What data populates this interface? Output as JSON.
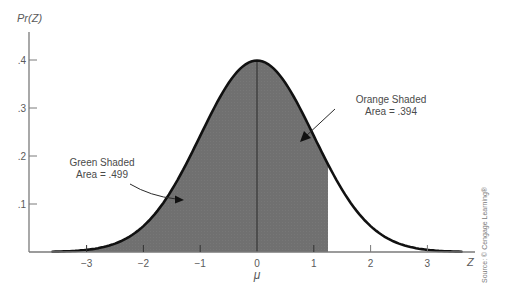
{
  "chart_data": {
    "type": "area",
    "title": "",
    "xlabel": "Z",
    "ylabel": "Pr(Z)",
    "x_center_label": "μ",
    "distribution": "standard normal",
    "xlim": [
      -3.7,
      3.7
    ],
    "ylim": [
      0,
      0.45
    ],
    "x_ticks": [
      -3,
      -2,
      -1,
      0,
      1,
      2,
      3
    ],
    "x_tick_labels": [
      "−3",
      "−2",
      "−1",
      "0",
      "1",
      "2",
      "3"
    ],
    "y_ticks": [
      0.1,
      0.2,
      0.3,
      0.4
    ],
    "y_tick_labels": [
      ".1",
      ".2",
      ".3",
      ".4"
    ],
    "grid": false,
    "curve_peak": 0.399,
    "shaded_regions": [
      {
        "name": "Green Shaded",
        "from": -3.0,
        "to": 0.0,
        "area": 0.499,
        "color": "#6e6e6e"
      },
      {
        "name": "Orange Shaded",
        "from": 0.0,
        "to": 1.25,
        "area": 0.394,
        "color": "#6e6e6e"
      }
    ],
    "annotations": [
      {
        "line1": "Green Shaded",
        "line2": "Area = .499",
        "arrow_target_z": -1.3
      },
      {
        "line1": "Orange Shaded",
        "line2": "Area = .394",
        "arrow_target_z": 0.7
      }
    ],
    "source": "Source: © Cengage Learning®"
  },
  "labels": {
    "y_axis": "Pr(Z)",
    "x_axis": "Z",
    "mu": "μ",
    "ann_green_1": "Green Shaded",
    "ann_green_2": "Area = .499",
    "ann_orange_1": "Orange Shaded",
    "ann_orange_2": "Area = .394",
    "source": "Source: © Cengage Learning®",
    "xt": [
      "−3",
      "−2",
      "−1",
      "0",
      "1",
      "2",
      "3"
    ],
    "yt": [
      ".1",
      ".2",
      ".3",
      ".4"
    ]
  }
}
